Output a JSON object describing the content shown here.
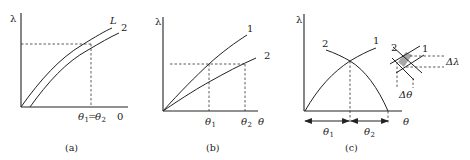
{
  "figure": {
    "panels": [
      {
        "id": "a",
        "caption": "(a)",
        "y_axis_label": "λ",
        "curve_labels": [
          "L",
          "2"
        ],
        "x_tick_label": "θ1=θ2",
        "x_axis_end_label": "0"
      },
      {
        "id": "b",
        "caption": "(b)",
        "y_axis_label": "λ",
        "x_axis_label": "θ",
        "curve_labels": [
          "1",
          "2"
        ],
        "x_tick_labels": [
          "θ1",
          "θ2"
        ]
      },
      {
        "id": "c",
        "caption": "(c)",
        "y_axis_label": "λ",
        "x_axis_label": "θ",
        "curve_labels": [
          "2",
          "1"
        ],
        "interval_labels": [
          "θ1",
          "θ2"
        ],
        "inset": {
          "curve_labels": [
            "2",
            "1"
          ],
          "delta_lambda": "Δλ",
          "delta_theta": "Δθ"
        }
      }
    ]
  },
  "text": {
    "a_lambda": "λ",
    "a_L": "L",
    "a_2": "2",
    "a_theta": "θ",
    "a_sub1": "1",
    "a_eq": "=",
    "a_sub2": "2",
    "a_zero": "0",
    "a_cap": "(a)",
    "b_lambda": "λ",
    "b_1": "1",
    "b_2": "2",
    "b_theta": "θ",
    "b_sub1": "1",
    "b_sub2": "2",
    "b_cap": "(b)",
    "c_lambda": "λ",
    "c_2": "2",
    "c_1": "1",
    "c_theta": "θ",
    "c_sub1": "1",
    "c_sub2": "2",
    "c_cap": "(c)",
    "c_in2": "2",
    "c_in1": "1",
    "c_dl": "Δλ",
    "c_dt": "Δθ"
  }
}
